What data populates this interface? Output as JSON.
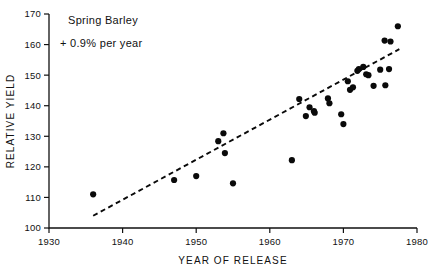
{
  "chart_data": {
    "type": "scatter",
    "title": "",
    "xlabel": "YEAR OF RELEASE",
    "ylabel": "RELATIVE YIELD",
    "xlim": [
      1930,
      1980
    ],
    "ylim": [
      100,
      170
    ],
    "xticks": [
      1930,
      1940,
      1950,
      1960,
      1970,
      1980
    ],
    "yticks": [
      100,
      110,
      120,
      130,
      140,
      150,
      160,
      170
    ],
    "grid": false,
    "legend": "none",
    "annotations": [
      "Spring Barley",
      "+ 0.9% per year"
    ],
    "series": [
      {
        "name": "Spring Barley varieties",
        "marker": "filled-circle",
        "color": "#0a0a0a",
        "points": [
          [
            1936.0,
            111.0
          ],
          [
            1947.0,
            115.7
          ],
          [
            1950.0,
            117.0
          ],
          [
            1953.0,
            128.4
          ],
          [
            1953.7,
            131.0
          ],
          [
            1953.9,
            124.5
          ],
          [
            1955.0,
            114.6
          ],
          [
            1963.0,
            122.2
          ],
          [
            1964.0,
            142.2
          ],
          [
            1964.9,
            136.6
          ],
          [
            1965.4,
            139.5
          ],
          [
            1966.0,
            138.2
          ],
          [
            1966.1,
            137.7
          ],
          [
            1967.9,
            142.4
          ],
          [
            1968.1,
            140.8
          ],
          [
            1969.7,
            137.2
          ],
          [
            1970.0,
            134.0
          ],
          [
            1970.6,
            148.0
          ],
          [
            1970.9,
            145.2
          ],
          [
            1971.3,
            146.0
          ],
          [
            1971.9,
            151.4
          ],
          [
            1972.1,
            152.0
          ],
          [
            1972.7,
            152.7
          ],
          [
            1973.1,
            150.3
          ],
          [
            1973.4,
            150.0
          ],
          [
            1974.1,
            146.5
          ],
          [
            1975.0,
            151.8
          ],
          [
            1975.6,
            161.3
          ],
          [
            1975.7,
            146.7
          ],
          [
            1976.2,
            152.0
          ],
          [
            1976.4,
            161.0
          ],
          [
            1977.4,
            166.0
          ]
        ]
      }
    ],
    "trendline": {
      "label": "+ 0.9% per year",
      "style": "dashed",
      "color": "#0a0a0a",
      "x_start": 1936.0,
      "y_start": 104.0,
      "x_end": 1977.6,
      "y_end": 158.5
    }
  }
}
